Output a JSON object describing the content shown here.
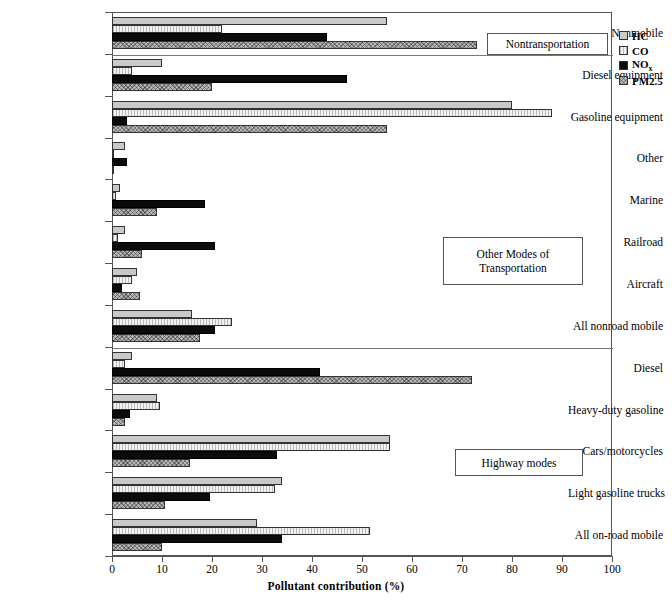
{
  "chart_data": {
    "type": "bar",
    "orientation": "horizontal",
    "title": "",
    "xlabel": "Pollutant contribution (%)",
    "ylabel": "",
    "xlim": [
      0,
      100
    ],
    "xticks": [
      0,
      10,
      20,
      30,
      40,
      50,
      60,
      70,
      80,
      90,
      100
    ],
    "grid": false,
    "legend_position": "right-top",
    "legend": [
      "HC",
      "CO",
      "NOx",
      "PM2.5"
    ],
    "series": [
      {
        "name": "HC",
        "key": "hc",
        "pattern": "solid-light-gray",
        "color": "#c9c9c9"
      },
      {
        "name": "CO",
        "key": "co",
        "pattern": "vertical-hatch",
        "color": "#d9d9d9"
      },
      {
        "name": "NOx",
        "key": "nox",
        "pattern": "solid-black",
        "color": "#0b0b0b"
      },
      {
        "name": "PM2.5",
        "key": "pm",
        "pattern": "crosshatch-gray",
        "color": "#a8a8a8"
      }
    ],
    "categories": [
      "Nonmobile",
      "Diesel equipment",
      "Gasoline equipment",
      "Other",
      "Marine",
      "Railroad",
      "Aircraft",
      "All nonroad mobile",
      "Diesel",
      "Heavy-duty gasoline",
      "Cars/motorcycles",
      "Light gasoline trucks",
      "All on-road mobile"
    ],
    "values": {
      "hc": [
        55.0,
        10.0,
        80.0,
        2.5,
        1.5,
        2.5,
        5.0,
        16.0,
        4.0,
        9.0,
        55.5,
        34.0,
        29.0
      ],
      "co": [
        22.0,
        4.0,
        88.0,
        0.4,
        0.8,
        1.2,
        4.0,
        24.0,
        2.5,
        9.5,
        55.5,
        32.5,
        51.5
      ],
      "nox": [
        43.0,
        47.0,
        3.0,
        3.0,
        18.5,
        20.5,
        2.0,
        20.5,
        41.5,
        3.5,
        33.0,
        19.5,
        34.0
      ],
      "pm": [
        73.0,
        20.0,
        55.0,
        0.3,
        9.0,
        6.0,
        5.5,
        17.5,
        72.0,
        2.5,
        15.5,
        10.5,
        10.0
      ]
    },
    "annotations": [
      {
        "text": "Nontransportation",
        "group": "nonmobile"
      },
      {
        "text": "Other Modes of\nTransportation",
        "group": "nonroad"
      },
      {
        "text": "Highway modes",
        "group": "highway"
      }
    ],
    "group_separators": [
      1,
      8
    ]
  },
  "legend_items": [
    {
      "label": "HC",
      "sub": ""
    },
    {
      "label": "CO",
      "sub": ""
    },
    {
      "label": "NO",
      "sub": "x"
    },
    {
      "label": "PM2.5",
      "sub": ""
    }
  ],
  "annotations": {
    "nontransportation": "Nontransportation",
    "other_modes_line1": "Other Modes of",
    "other_modes_line2": "Transportation",
    "highway": "Highway modes"
  },
  "axis": {
    "x_title": "Pollutant contribution (%)"
  }
}
